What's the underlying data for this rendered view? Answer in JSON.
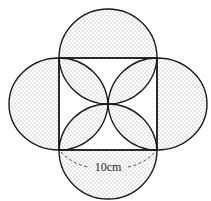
{
  "diagram": {
    "label": "10cm",
    "colors": {
      "stroke": "#1a1a1a",
      "dots": "#8a8a8a",
      "background": "#ffffff"
    },
    "shapes": [
      "square",
      "top-semicircle",
      "bottom-semicircle",
      "left-semi-ellipse",
      "right-semi-ellipse",
      "four-petal-rosette"
    ]
  }
}
